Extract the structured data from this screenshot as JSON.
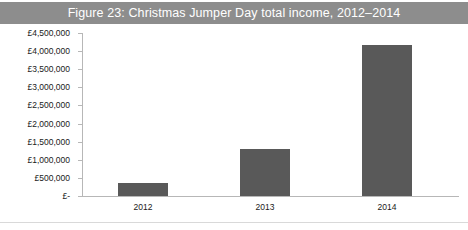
{
  "figure": {
    "title": "Figure 23: Christmas Jumper Day total income, 2012–2014",
    "title_bar_color": "#8d8d8d",
    "title_text_color": "#ffffff",
    "bar_color": "#595959",
    "axis_color": "#b7b7b7",
    "background_color": "#ffffff"
  },
  "chart_data": {
    "type": "bar",
    "title": "Figure 23: Christmas Jumper Day total income, 2012–2014",
    "xlabel": "",
    "ylabel": "",
    "categories": [
      "2012",
      "2013",
      "2014"
    ],
    "values": [
      360000,
      1300000,
      4180000
    ],
    "value_labels": [
      "£360,000",
      "£1,300,000",
      "£4,180,000"
    ],
    "ylim": [
      0,
      4500000
    ],
    "ytick_values": [
      0,
      500000,
      1000000,
      1500000,
      2000000,
      2500000,
      3000000,
      3500000,
      4000000,
      4500000
    ],
    "ytick_labels": [
      "£-",
      "£500,000",
      "£1,000,000",
      "£1,500,000",
      "£2,000,000",
      "£2,500,000",
      "£3,000,000",
      "£3,500,000",
      "£4,000,000",
      "£4,500,000"
    ],
    "grid": false,
    "legend": false,
    "legend_position": "none",
    "series": [
      {
        "name": "Total income",
        "values": [
          360000,
          1300000,
          4180000
        ]
      }
    ]
  }
}
